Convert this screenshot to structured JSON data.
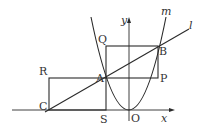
{
  "diagram": {
    "colors": {
      "line": "#2a2a2a",
      "text": "#333333",
      "background": "#ffffff"
    },
    "labels": {
      "y_axis": "y",
      "x_axis": "x",
      "origin": "O",
      "curve_m": "m",
      "line_l": "l",
      "A": "A",
      "B": "B",
      "C": "C",
      "P": "P",
      "Q": "Q",
      "R": "R",
      "S": "S"
    },
    "elements": [
      "x-axis",
      "y-axis",
      "parabola m (vertex at O)",
      "line l through C, A, B",
      "rectangle ASOP-side region APBQ",
      "rectangle RASC"
    ]
  }
}
